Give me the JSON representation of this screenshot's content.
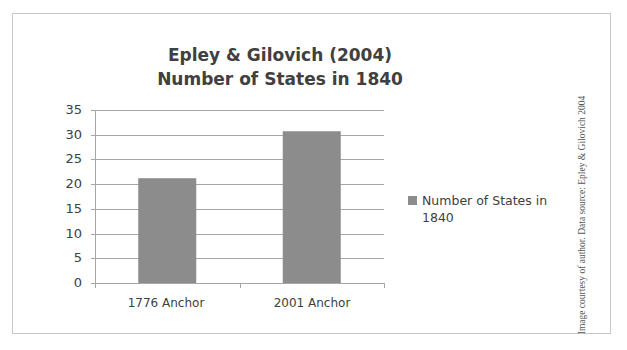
{
  "chart_data": {
    "type": "bar",
    "title": "Epley & Gilovich (2004)\nNumber of States in 1840",
    "title_lines": [
      "Epley & Gilovich (2004)",
      "Number of States in 1840"
    ],
    "categories": [
      "1776 Anchor",
      "2001 Anchor"
    ],
    "series": [
      {
        "name": "Number of States in 1840",
        "values": [
          21.2,
          30.7
        ],
        "color": "#8c8c8c"
      }
    ],
    "values": [
      21.2,
      30.7
    ],
    "xlabel": "",
    "ylabel": "",
    "ylim": [
      0,
      35
    ],
    "yticks": [
      0,
      5,
      10,
      15,
      20,
      25,
      30,
      35
    ],
    "grid": true,
    "legend_position": "right"
  },
  "legend": {
    "label": "Number of States in 1840"
  },
  "credit": "Image courtesy of author. Data source: Epley & Gilovich 2004",
  "colors": {
    "bar": "#8c8c8c",
    "grid": "#a6a6a6",
    "text": "#404040",
    "frame": "#c8c8c8"
  }
}
